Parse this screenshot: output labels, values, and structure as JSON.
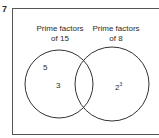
{
  "question_number": "7",
  "venn": {
    "left_set": {
      "title_line1": "Prime factors",
      "title_line2": "of 15",
      "elements": [
        "5",
        "3"
      ]
    },
    "right_set": {
      "title_line1": "Prime factors",
      "title_line2": "of 8",
      "element_base": "2",
      "element_exp": "3"
    },
    "intersection": []
  }
}
